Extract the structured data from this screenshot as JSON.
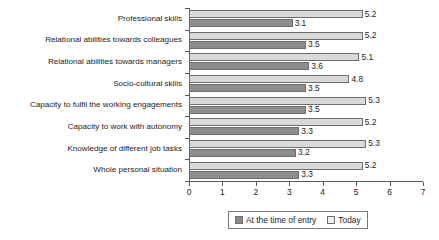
{
  "chart_data": {
    "type": "bar",
    "orientation": "horizontal",
    "title": "",
    "xlabel": "",
    "ylabel": "",
    "xlim": [
      0,
      7
    ],
    "xticks": [
      "0",
      "1",
      "2",
      "3",
      "4",
      "5",
      "6",
      "7"
    ],
    "grid": false,
    "legend_position": "bottom",
    "categories": [
      "Professional skills",
      "Relational abilities towards colleagues",
      "Relational abilities towards managers",
      "Socio-cultural skills",
      "Capacity to fulfil the working engagements",
      "Capacity to work with autonomy",
      "Knowledge of different job tasks",
      "Whole personal situation"
    ],
    "series": [
      {
        "name": "Today",
        "color": "#d9d9d9",
        "values": [
          5.2,
          5.2,
          5.1,
          4.8,
          5.3,
          5.2,
          5.3,
          5.2
        ],
        "labels": [
          "5.2",
          "5.2",
          "5.1",
          "4.8",
          "5.3",
          "5.2",
          "5.3",
          "5.2"
        ]
      },
      {
        "name": "At the time of entry",
        "color": "#8d8d8d",
        "values": [
          3.1,
          3.5,
          3.6,
          3.5,
          3.5,
          3.3,
          3.2,
          3.3
        ],
        "labels": [
          "3.1",
          "3.5",
          "3.6",
          "3.5",
          "3.5",
          "3.3",
          "3.2",
          "3.3"
        ]
      }
    ]
  },
  "legend": {
    "entry_label": "At the time of entry",
    "today_label": "Today"
  }
}
